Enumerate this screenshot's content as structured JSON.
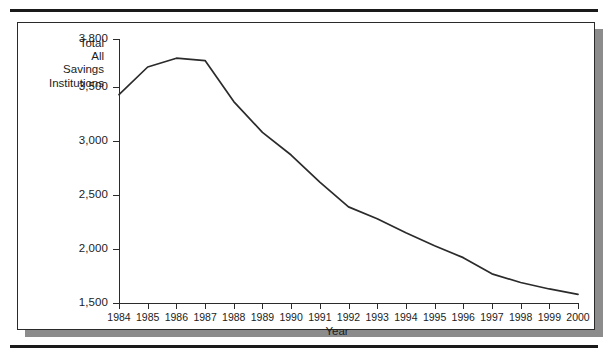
{
  "figure": {
    "series_label_lines": [
      "Total",
      "All",
      "Savings",
      "Institutions"
    ],
    "x_axis_title": "Year"
  },
  "chart_data": {
    "type": "line",
    "title": "",
    "subtitle": "",
    "xlabel": "Year",
    "ylabel": "Total All Savings Institutions",
    "categories": [
      "1984",
      "1985",
      "1986",
      "1987",
      "1988",
      "1989",
      "1990",
      "1991",
      "1992",
      "1993",
      "1994",
      "1995",
      "1996",
      "1997",
      "1998",
      "1999",
      "2000"
    ],
    "x": [
      1984,
      1985,
      1986,
      1987,
      1988,
      1989,
      1990,
      1991,
      1992,
      1993,
      1994,
      1995,
      1996,
      1997,
      1998,
      1999,
      2000
    ],
    "values": [
      3430,
      3625,
      3680,
      3665,
      3365,
      3080,
      2870,
      2620,
      2390,
      2280,
      2150,
      2030,
      1920,
      1770,
      1690,
      1630,
      1580
    ],
    "series": [
      {
        "name": "Total All Savings Institutions",
        "values": [
          3430,
          3625,
          3680,
          3665,
          3365,
          3080,
          2870,
          2620,
          2390,
          2280,
          2150,
          2030,
          1920,
          1770,
          1690,
          1630,
          1580
        ]
      }
    ],
    "ytick_labels": [
      "3,800",
      "3,500",
      "3,000",
      "2,500",
      "2,000",
      "1,500"
    ],
    "ytick_values": [
      3800,
      3500,
      3000,
      2500,
      2000,
      1500
    ],
    "xtick_labels": [
      "1984",
      "1985",
      "1986",
      "1987",
      "1988",
      "1989",
      "1990",
      "1991",
      "1992",
      "1993",
      "1994",
      "1995",
      "1996",
      "1997",
      "1998",
      "1999",
      "2000"
    ],
    "ylim": [
      1500,
      3800
    ],
    "xlim": [
      1984,
      2000
    ],
    "grid": false,
    "legend": "none",
    "line_color": "#2b2b2b",
    "background_color": "#ffffff"
  }
}
